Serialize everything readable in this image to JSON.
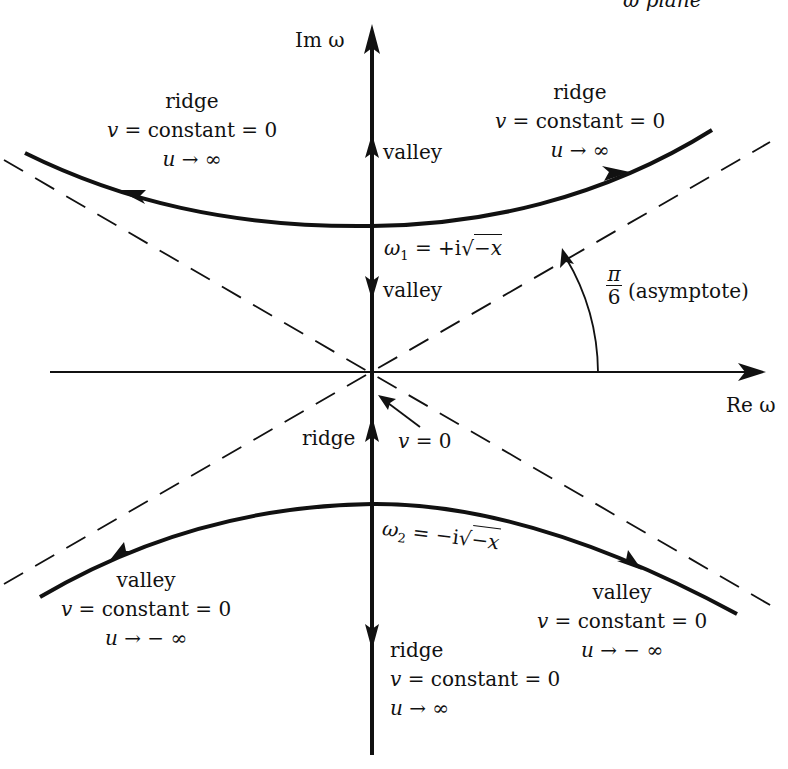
{
  "figure": {
    "plane_label_clipped": "ω plane",
    "axes": {
      "imag": "Im ω",
      "real": "Re ω"
    },
    "saddle_points": {
      "upper": {
        "lhs": "ω",
        "sub": "1",
        "rhs_prefix": "= +i",
        "rad": "−x"
      },
      "lower": {
        "lhs": "ω",
        "sub": "2",
        "rhs_prefix": "= −i",
        "rad": "−x"
      }
    },
    "angle": {
      "numerator": "π",
      "denominator": "6",
      "note": "(asymptote)"
    },
    "origin_note": {
      "var": "v",
      "eq": "= 0"
    },
    "axis_labels": {
      "upper_valley_1": "valley",
      "upper_valley_2": "valley",
      "lower_ridge_1": "ridge"
    },
    "regions": {
      "upper_left": {
        "title": "ridge",
        "v": "v",
        "v_eq": "= constant = 0",
        "u": "u",
        "u_lim": "→ ∞"
      },
      "upper_right": {
        "title": "ridge",
        "v": "v",
        "v_eq": "= constant = 0",
        "u": "u",
        "u_lim": "→ ∞"
      },
      "lower_left": {
        "title": "valley",
        "v": "v",
        "v_eq": "= constant = 0",
        "u": "u",
        "u_lim": "→ − ∞"
      },
      "lower_right": {
        "title": "valley",
        "v": "v",
        "v_eq": "= constant = 0",
        "u": "u",
        "u_lim": "→ − ∞"
      },
      "bottom": {
        "title": "ridge",
        "v": "v",
        "v_eq": "= constant = 0",
        "u": "u",
        "u_lim": "→ ∞"
      }
    },
    "style": {
      "ink": "#111111",
      "background": "#ffffff",
      "asymptote_angle_deg": 30
    }
  }
}
